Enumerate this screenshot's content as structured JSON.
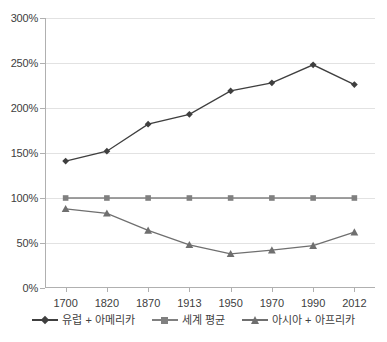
{
  "chart_data": {
    "type": "line",
    "title": "",
    "subtitle": "",
    "xlabel": "",
    "ylabel": "",
    "categories": [
      "1700",
      "1820",
      "1870",
      "1913",
      "1950",
      "1970",
      "1990",
      "2012"
    ],
    "ylim": [
      0,
      300
    ],
    "ytick_values": [
      0,
      50,
      100,
      150,
      200,
      250,
      300
    ],
    "ytick_labels": [
      "0%",
      "50%",
      "100%",
      "150%",
      "200%",
      "250%",
      "300%"
    ],
    "grid": true,
    "legend_position": "bottom",
    "series": [
      {
        "name": "유럽 + 아메리카",
        "marker": "diamond",
        "color": "#3f3f3f",
        "values": [
          141,
          152,
          182,
          193,
          219,
          228,
          248,
          226
        ]
      },
      {
        "name": "세계 평균",
        "marker": "square",
        "color": "#808080",
        "values": [
          100,
          100,
          100,
          100,
          100,
          100,
          100,
          100
        ]
      },
      {
        "name": "아시아 + 아프리카",
        "marker": "triangle",
        "color": "#6f6f6f",
        "values": [
          88,
          83,
          64,
          48,
          38,
          42,
          47,
          62
        ]
      }
    ]
  },
  "axis": {
    "y_labels": [
      "300%",
      "250%",
      "200%",
      "150%",
      "100%",
      "50%",
      "0%"
    ],
    "x_labels": [
      "1700",
      "1820",
      "1870",
      "1913",
      "1950",
      "1970",
      "1990",
      "2012"
    ]
  },
  "legend": {
    "entries": [
      {
        "label": "유럽 + 아메리카",
        "marker": "diamond-marker"
      },
      {
        "label": "세계 평균",
        "marker": "square-marker"
      },
      {
        "label": "아시아 + 아프리카",
        "marker": "triangle-marker"
      }
    ]
  },
  "colors": {
    "series1": "#3f3f3f",
    "series2": "#808080",
    "series3": "#6f6f6f",
    "grid": "#e2e2e2",
    "axis": "#b0b0b0",
    "text": "#404040",
    "background": "#ffffff"
  }
}
